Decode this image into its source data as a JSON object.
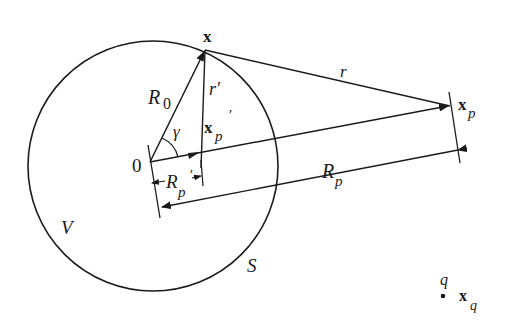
{
  "diagram": {
    "type": "geometry",
    "colors": {
      "ink": "#1a1a1a",
      "background": "#ffffff"
    },
    "labels": {
      "x": "x",
      "r": "r",
      "R0": "R",
      "R0_sub": "0",
      "r_prime": "r′",
      "xp_prime": "x",
      "xp_prime_sub": "p",
      "xp_prime_mark": "′",
      "gamma": "γ",
      "origin": "0",
      "Rp_prime": "R",
      "Rp_prime_sub": "p",
      "Rp_prime_mark": "′",
      "Rp": "R",
      "Rp_sub": "p",
      "xp": "x",
      "xp_sub": "p",
      "V": "V",
      "S": "S",
      "q": "q",
      "xq": "x",
      "xq_sub": "q"
    }
  }
}
